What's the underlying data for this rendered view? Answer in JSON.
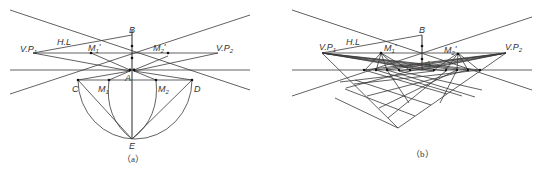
{
  "figure": {
    "panels": [
      {
        "id": "a",
        "caption": "（a）",
        "labels": {
          "B": "B",
          "VP1": "V.P",
          "VP1_sub": "1",
          "VP2": "V.P",
          "VP2_sub": "2",
          "HL": "H.L",
          "M1prime": "M",
          "M1prime_sub": "1",
          "M1prime_mark": "'",
          "M2prime": "M",
          "M2prime_sub": "2",
          "M2prime_mark": "'",
          "A": "A",
          "C": "C",
          "D": "D",
          "M1": "M",
          "M1_sub": "1",
          "M2": "M",
          "M2_sub": "2",
          "E": "E"
        }
      },
      {
        "id": "b",
        "caption": "（b）",
        "labels": {
          "B": "B",
          "VP1": "V.P",
          "VP1_sub": "1",
          "VP2": "V.P",
          "VP2_sub": "2",
          "HL": "H.L",
          "M1prime": "M",
          "M1prime_sub": "1",
          "M1prime_mark": "'",
          "M2prime": "M",
          "M2prime_sub": "2",
          "M2prime_mark": "'",
          "A": "A"
        }
      }
    ]
  }
}
